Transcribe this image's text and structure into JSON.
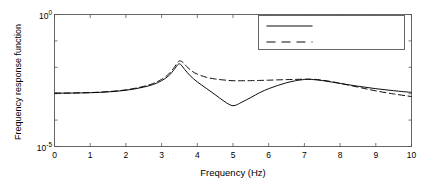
{
  "chart_data": {
    "type": "line",
    "title": "",
    "xlabel": "Frequency (Hz)",
    "ylabel": "Frequency response function",
    "xlim": [
      0,
      10
    ],
    "ylim": [
      1e-05,
      1
    ],
    "yscale": "log",
    "xscale": "linear",
    "grid": false,
    "legend_position": "top-right",
    "xticks": [
      "0",
      "1",
      "2",
      "3",
      "4",
      "5",
      "6",
      "7",
      "8",
      "9",
      "10"
    ],
    "xtick_values": [
      0,
      1,
      2,
      3,
      4,
      5,
      6,
      7,
      8,
      9,
      10
    ],
    "ytick_labels": [
      "10",
      "10"
    ],
    "ytick_exponents": [
      "0",
      "-5"
    ],
    "ytick_values": [
      1.0,
      1e-05
    ],
    "series": [
      {
        "name": "Direct FRF H(1,1)",
        "style": "solid",
        "color": "#000000",
        "x": [
          0.0,
          0.25,
          0.5,
          0.75,
          1.0,
          1.25,
          1.5,
          1.75,
          2.0,
          2.25,
          2.5,
          2.75,
          3.0,
          3.2,
          3.35,
          3.45,
          3.5,
          3.55,
          3.65,
          3.8,
          4.0,
          4.25,
          4.5,
          4.75,
          5.0,
          5.25,
          5.5,
          5.75,
          6.0,
          6.25,
          6.5,
          6.75,
          7.0,
          7.1,
          7.25,
          7.5,
          7.75,
          8.0,
          8.5,
          9.0,
          9.5,
          10.0
        ],
        "y": [
          0.00105,
          0.00105,
          0.00106,
          0.00107,
          0.00109,
          0.00112,
          0.00117,
          0.00124,
          0.00135,
          0.00152,
          0.00178,
          0.0022,
          0.0031,
          0.0048,
          0.0082,
          0.0125,
          0.0135,
          0.0122,
          0.0082,
          0.0048,
          0.0028,
          0.0016,
          0.00092,
          0.00052,
          0.00035,
          0.00048,
          0.00072,
          0.0011,
          0.00155,
          0.00205,
          0.0026,
          0.0031,
          0.00345,
          0.0035,
          0.00342,
          0.00315,
          0.00278,
          0.00245,
          0.00192,
          0.00155,
          0.0013,
          0.00112
        ]
      },
      {
        "name": "Transfer FRF H(1,2)",
        "style": "dashed",
        "color": "#000000",
        "x": [
          0.0,
          0.25,
          0.5,
          0.75,
          1.0,
          1.25,
          1.5,
          1.75,
          2.0,
          2.25,
          2.5,
          2.75,
          3.0,
          3.2,
          3.35,
          3.45,
          3.52,
          3.6,
          3.7,
          3.85,
          4.0,
          4.25,
          4.5,
          4.75,
          5.0,
          5.25,
          5.5,
          5.75,
          6.0,
          6.25,
          6.5,
          6.75,
          7.0,
          7.15,
          7.3,
          7.5,
          7.75,
          8.0,
          8.5,
          9.0,
          9.5,
          10.0
        ],
        "y": [
          0.00105,
          0.00105,
          0.00106,
          0.00108,
          0.0011,
          0.00114,
          0.0012,
          0.00128,
          0.0014,
          0.0016,
          0.0019,
          0.0024,
          0.0035,
          0.0056,
          0.0098,
          0.0155,
          0.0175,
          0.0152,
          0.0108,
          0.0072,
          0.0055,
          0.0042,
          0.0036,
          0.0033,
          0.0031,
          0.0031,
          0.00312,
          0.00318,
          0.00325,
          0.00334,
          0.00342,
          0.00349,
          0.00354,
          0.00355,
          0.00348,
          0.00325,
          0.00288,
          0.00248,
          0.00178,
          0.00128,
          0.00098,
          0.00078
        ]
      }
    ]
  },
  "legend": {
    "entries": [
      {
        "label": "Direct FRF H(1,1)",
        "style": "solid"
      },
      {
        "label": "Transfer FRF H(1,2)",
        "style": "dashed"
      }
    ]
  },
  "axes": {
    "x_title": "Frequency (Hz)",
    "y_title": "Frequency response function",
    "ytop_mantissa": "10",
    "ytop_exponent": "0",
    "ybottom_mantissa": "10",
    "ybottom_exponent": "-5"
  }
}
